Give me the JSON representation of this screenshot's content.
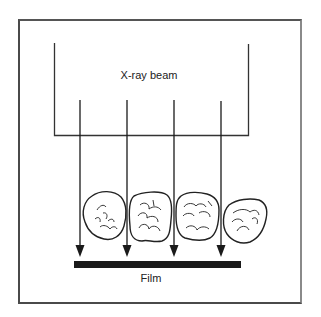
{
  "diagram": {
    "labels": {
      "beam": "X-ray beam",
      "film": "Film"
    },
    "elements": {
      "beam_source_bracket": {
        "left_x": 54,
        "right_x": 248,
        "top_y": 43,
        "bottom_y": 136
      },
      "rays": [
        {
          "x": 80,
          "y_start": 100,
          "y_end": 256
        },
        {
          "x": 127,
          "y_start": 100,
          "y_end": 256
        },
        {
          "x": 174,
          "y_start": 100,
          "y_end": 256
        },
        {
          "x": 221,
          "y_start": 101,
          "y_end": 256
        }
      ],
      "teeth_count": 4,
      "film_bar": {
        "x1": 74,
        "x2": 241,
        "y": 261,
        "height": 7
      }
    },
    "colors": {
      "line": "#222222",
      "film": "#1a1a1a",
      "frame": "#4a4a4a",
      "background": "#ffffff"
    }
  }
}
